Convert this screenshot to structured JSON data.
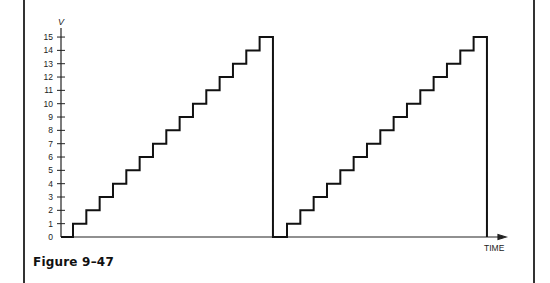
{
  "caption": "Figure 9–47",
  "chart_data": {
    "type": "line",
    "subtype": "staircase",
    "title": "",
    "xlabel": "TIME",
    "ylabel": "V",
    "yticks": [
      "0",
      "1",
      "2",
      "3",
      "4",
      "5",
      "6",
      "7",
      "8",
      "9",
      "10",
      "11",
      "12",
      "13",
      "14",
      "15"
    ],
    "ylim": [
      0,
      15
    ],
    "grid": false,
    "legend": null,
    "series": [
      {
        "name": "staircase voltage",
        "description": "Two staircase ramps, each stepping 1 V per step from 0 to 15 V, then dropping back to 0",
        "ramps": [
          {
            "start_step_x": 1,
            "levels": [
              0,
              1,
              2,
              3,
              4,
              5,
              6,
              7,
              8,
              9,
              10,
              11,
              12,
              13,
              14,
              15,
              0
            ]
          },
          {
            "start_step_x": 2,
            "levels": [
              0,
              1,
              2,
              3,
              4,
              5,
              6,
              7,
              8,
              9,
              10,
              11,
              12,
              13,
              14,
              15,
              0
            ]
          }
        ]
      }
    ]
  }
}
